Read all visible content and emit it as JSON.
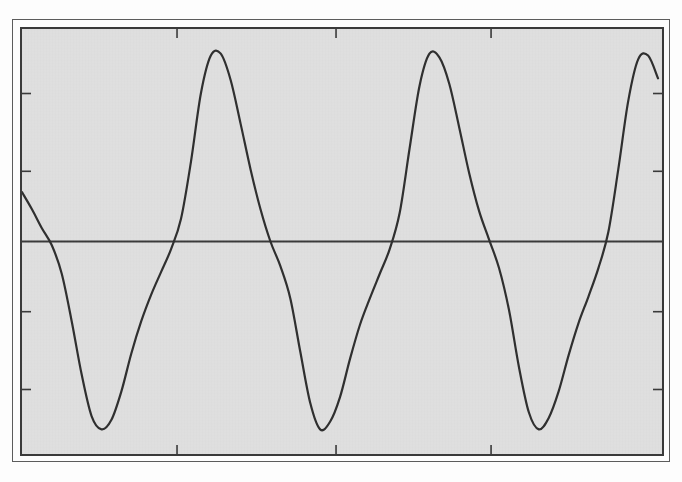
{
  "page": {
    "kind": "scanned-figure",
    "paper_color": "#fdfdfd",
    "ink_color": "#2f2f2f"
  },
  "figure": {
    "frame": {
      "outer_border_color": "#5c5c5c",
      "inner_border_color": "#3a3a3a",
      "plot_background_color": "#e0e0e0"
    },
    "caption": "",
    "title": ""
  },
  "bleed_through_text": [
    {
      "text": "of the signal is shown in the figure below",
      "x": 46,
      "y": 163,
      "size": 13
    },
    {
      "text": "period waveform and its harmonic content",
      "x": 46,
      "y": 181,
      "size": 13
    },
    {
      "text": "amplitude is normalised to unity",
      "x": 46,
      "y": 199,
      "size": 13
    },
    {
      "text": "the resulting spectrum contains only odd",
      "x": 46,
      "y": 258,
      "size": 13
    },
    {
      "text": "harmonics of the fundamental frequency",
      "x": 46,
      "y": 276,
      "size": 13
    },
    {
      "text": "which decay approximately as one over n",
      "x": 46,
      "y": 316,
      "size": 13
    },
    {
      "text": "squared for this class of excitation",
      "x": 46,
      "y": 334,
      "size": 13
    },
    {
      "text": "measured response",
      "x": 46,
      "y": 374,
      "size": 13
    }
  ],
  "chart_data": {
    "type": "line",
    "title": "",
    "subtitle": "",
    "xlabel": "",
    "ylabel": "",
    "grid": false,
    "legend": null,
    "legend_position": "none",
    "xlim": [
      0,
      3.22
    ],
    "ylim": [
      -1.12,
      1.12
    ],
    "axis_line_y": 0,
    "line_color": "#2f2f2f",
    "line_width": 2.2,
    "axis_ticks": {
      "top": {
        "values": [
          0.78,
          1.58,
          2.36
        ],
        "direction": "inward",
        "labels": []
      },
      "bottom": {
        "values": [
          0.78,
          1.58,
          2.36
        ],
        "direction": "inward",
        "labels": []
      },
      "left": {
        "values": [
          0.78,
          0.37,
          -0.37,
          -0.78
        ],
        "direction": "inward",
        "labels": []
      },
      "right": {
        "values": [
          0.78,
          0.37,
          -0.37,
          -0.78
        ],
        "direction": "inward",
        "labels": []
      }
    },
    "waveform": {
      "description": "periodic non-sinusoidal wave with narrow peaks and troughs",
      "period": 1.0,
      "peak_value": 1.0,
      "trough_value": -1.0,
      "phase_offset": 0.335,
      "peaks_x": [
        0.89,
        1.92,
        2.88
      ],
      "troughs_x": [
        0.4,
        1.41,
        2.4
      ],
      "zero_crossings_x": [
        0.15,
        0.64,
        1.16,
        1.65,
        2.14,
        2.65,
        3.14
      ],
      "start_value": 0.26,
      "end_value": -0.12
    },
    "series": [
      {
        "name": "waveform",
        "x": [
          0.0,
          0.05,
          0.1,
          0.15,
          0.2,
          0.25,
          0.3,
          0.35,
          0.4,
          0.45,
          0.5,
          0.55,
          0.6,
          0.65,
          0.7,
          0.75,
          0.8,
          0.85,
          0.9,
          0.95,
          1.0,
          1.05,
          1.1,
          1.15,
          1.2,
          1.25,
          1.3,
          1.35,
          1.4,
          1.45,
          1.5,
          1.55,
          1.6,
          1.65,
          1.7,
          1.75,
          1.8,
          1.85,
          1.9,
          1.95,
          2.0,
          2.05,
          2.1,
          2.15,
          2.2,
          2.25,
          2.3,
          2.35,
          2.4,
          2.45,
          2.5,
          2.55,
          2.6,
          2.65,
          2.7,
          2.75,
          2.8,
          2.85,
          2.9,
          2.95,
          3.0,
          3.05,
          3.1,
          3.15,
          3.2
        ],
        "y": [
          0.26,
          0.17,
          0.07,
          -0.02,
          -0.17,
          -0.42,
          -0.7,
          -0.92,
          -0.99,
          -0.94,
          -0.79,
          -0.59,
          -0.42,
          -0.28,
          -0.16,
          -0.04,
          0.12,
          0.42,
          0.78,
          0.98,
          0.99,
          0.85,
          0.62,
          0.38,
          0.17,
          0.0,
          -0.13,
          -0.3,
          -0.58,
          -0.85,
          -0.99,
          -0.95,
          -0.82,
          -0.62,
          -0.44,
          -0.3,
          -0.17,
          -0.04,
          0.15,
          0.49,
          0.82,
          0.99,
          0.97,
          0.83,
          0.6,
          0.36,
          0.16,
          0.01,
          -0.14,
          -0.36,
          -0.66,
          -0.9,
          -0.99,
          -0.93,
          -0.79,
          -0.6,
          -0.43,
          -0.29,
          -0.14,
          0.05,
          0.38,
          0.74,
          0.96,
          0.98,
          0.86
        ]
      }
    ]
  }
}
